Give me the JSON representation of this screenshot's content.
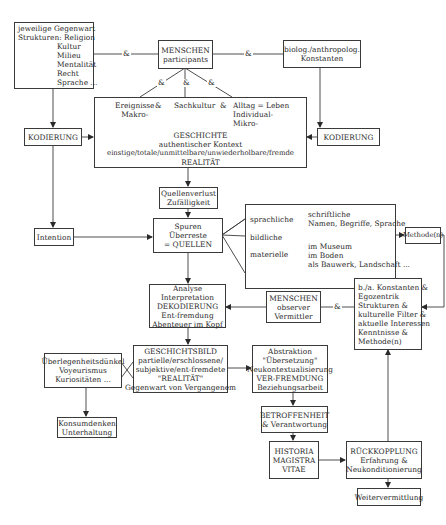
{
  "boxes": {
    "gegenwart": {
      "lines": [
        "jeweilige Gegenwart",
        "Strukturen: Religion",
        "Kultur",
        "Milieu",
        "Mentalität",
        "Recht",
        "Sprache ..."
      ]
    },
    "menschen_participants": {
      "lines": [
        "MENSCHEN",
        "participants"
      ]
    },
    "konstanten_top": {
      "lines": [
        "biolog./anthropolog.",
        "Konstanten"
      ]
    },
    "kodierung_left": {
      "label": "KODIERUNG"
    },
    "kodierung_right": {
      "label": "KODIERUNG"
    },
    "geschichte": {
      "columns": [
        {
          "lines": [
            "Ereignisse",
            "Makro-"
          ]
        },
        {
          "lines": [
            "Sachkultur"
          ]
        },
        {
          "lines": [
            "Alltag = Leben",
            "Individual-",
            "Mikro-"
          ]
        }
      ],
      "column_connector": "&",
      "lines": [
        "GESCHICHTE",
        "authentischer Kontext",
        "einstige/totale/unmittelbare/unwiederholbare/fremde",
        "REALITÄT"
      ]
    },
    "quellenverlust": {
      "lines": [
        "Quellenverlust",
        "Zufälligkeit"
      ]
    },
    "intention": {
      "label": "Intention"
    },
    "spuren": {
      "lines": [
        "Spuren",
        "Überreste",
        "= QUELLEN"
      ]
    },
    "quellen_types": {
      "sprachliche": {
        "label": "sprachliche",
        "items": [
          "schriftliche",
          "Namen, Begriffe, Sprache"
        ]
      },
      "bildliche": {
        "label": "bildliche"
      },
      "materielle": {
        "label": "materielle",
        "items": [
          "im Museum",
          "im Boden",
          "als Bauwerk, Landschaft ..."
        ]
      }
    },
    "methode": {
      "label": "Methode(n)"
    },
    "analyse": {
      "lines": [
        "Analyse",
        "Interpretation",
        "DEKODIERUNG",
        "Ent-fremdung",
        "Abenteuer im Kopf"
      ]
    },
    "menschen_observer": {
      "lines": [
        "MENSCHEN",
        "observer",
        "Vermittler"
      ]
    },
    "konstanten_right": {
      "lines": [
        "b./a. Konstanten &",
        "Egozentrik",
        "Strukturen &",
        "kulturelle Filter &",
        "aktuelle Interessen",
        "Kenntnisse &",
        "Methode(n)"
      ]
    },
    "geschichtsbild": {
      "lines": [
        "GESCHICHTSBILD",
        "partielle/erschlossene/",
        "subjektive/ent-fremdete",
        "\"REALITÄT\"",
        "Gegenwart von Vergangenem"
      ]
    },
    "ueberlegenheit": {
      "lines": [
        "Überlegenheitsdünkel",
        "Voyeurismus",
        "Kuriositäten ..."
      ]
    },
    "abstraktion": {
      "lines": [
        "Abstraktion",
        "\"Übersetzung\"",
        "Neukontextualisierung",
        "VER-FREMDUNG",
        "Beziehungsarbeit"
      ]
    },
    "konsumdenken": {
      "lines": [
        "Konsumdenken",
        "Unterhaltung"
      ]
    },
    "betroffenheit": {
      "lines": [
        "BETROFFENHEIT",
        "& Verantwortung"
      ]
    },
    "historia": {
      "lines": [
        "HISTORIA",
        "MAGISTRA",
        "VITAE"
      ]
    },
    "rueckkopplung": {
      "lines": [
        "RÜCKKOPPLUNG",
        "Erfahrung &",
        "Neukonditionierung"
      ]
    },
    "weitervermittlung": {
      "label": "Weitervermittlung"
    }
  },
  "connectors": {
    "and": "&"
  },
  "colors": {
    "line": "#3a3a3a",
    "text": "#2a2a2a",
    "background": "#ffffff"
  }
}
